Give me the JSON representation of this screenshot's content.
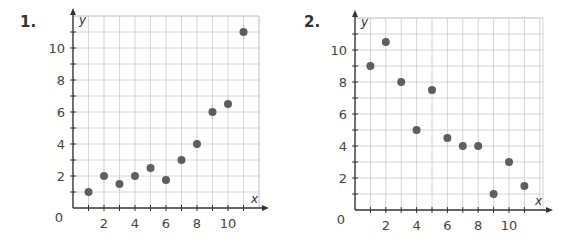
{
  "problems": [
    {
      "number": "1."
    },
    {
      "number": "2."
    }
  ],
  "chart_data": [
    {
      "type": "scatter",
      "title": "1.",
      "xlabel": "x",
      "ylabel": "y",
      "origin_label": "0",
      "xlim": [
        0,
        12
      ],
      "ylim": [
        0,
        12
      ],
      "grid": true,
      "x_ticks": [
        2,
        4,
        6,
        8,
        10
      ],
      "y_ticks": [
        2,
        4,
        6,
        8,
        10
      ],
      "x": [
        1,
        2,
        3,
        4,
        5,
        6,
        7,
        8,
        9,
        10,
        11
      ],
      "y": [
        1,
        2,
        1.5,
        2,
        2.5,
        1.75,
        3,
        4,
        6,
        6.5,
        11
      ],
      "point_color": "#5e5e5e"
    },
    {
      "type": "scatter",
      "title": "2.",
      "xlabel": "x",
      "ylabel": "y",
      "origin_label": "0",
      "xlim": [
        0,
        12
      ],
      "ylim": [
        0,
        12
      ],
      "grid": true,
      "x_ticks": [
        2,
        4,
        6,
        8,
        10
      ],
      "y_ticks": [
        2,
        4,
        6,
        8,
        10
      ],
      "x": [
        1,
        2,
        3,
        4,
        5,
        6,
        7,
        8,
        9,
        10,
        11
      ],
      "y": [
        9,
        10.5,
        8,
        5,
        7.5,
        4.5,
        4,
        4,
        1,
        3,
        1.5
      ],
      "point_color": "#5e5e5e"
    }
  ]
}
